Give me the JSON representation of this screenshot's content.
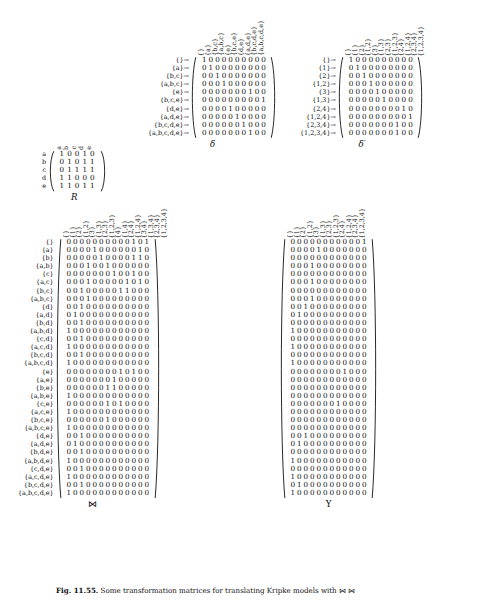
{
  "figure": {
    "caption_bold": "Fig. 11.55.",
    "caption_rest": "Some transformation matrices for translating Kripke models with ⋈ ⋈"
  },
  "blocks": {
    "R": {
      "label": "R",
      "row_labels": [
        "a",
        "b",
        "c",
        "d",
        "e"
      ],
      "col_labels": [
        "a",
        "b",
        "c",
        "d",
        "e"
      ],
      "col_rotated": true,
      "rows": [
        [
          1,
          0,
          0,
          1,
          0
        ],
        [
          0,
          1,
          0,
          1,
          1
        ],
        [
          0,
          1,
          1,
          1,
          1
        ],
        [
          1,
          1,
          0,
          0,
          0
        ],
        [
          1,
          1,
          0,
          1,
          1
        ]
      ]
    },
    "delta": {
      "label": "δ",
      "row_labels": [
        "{}→",
        "{a}→",
        "{b,c}→",
        "{a,b,c}→",
        "{e}→",
        "{b,c,e}→",
        "{d,e}→",
        "{a,d,e}→",
        "{b,c,d,e}→",
        "{a,b,c,d,e}→"
      ],
      "col_labels": [
        "{}",
        "{a}",
        "{b,c}",
        "{a,b,c}",
        "{e}",
        "{b,c,e}",
        "{d,e}",
        "{a,d,e}",
        "{b,c,d,e}",
        "{a,b,c,d,e}"
      ],
      "col_rotated": true,
      "rows": [
        [
          1,
          0,
          0,
          0,
          0,
          0,
          0,
          0,
          0,
          0
        ],
        [
          0,
          1,
          0,
          0,
          0,
          0,
          0,
          0,
          0,
          0
        ],
        [
          0,
          0,
          1,
          0,
          0,
          0,
          0,
          0,
          0,
          0
        ],
        [
          0,
          0,
          0,
          1,
          0,
          0,
          0,
          0,
          0,
          0
        ],
        [
          0,
          0,
          0,
          0,
          0,
          0,
          0,
          1,
          0,
          0
        ],
        [
          0,
          0,
          0,
          0,
          0,
          0,
          0,
          0,
          0,
          1
        ],
        [
          0,
          0,
          0,
          0,
          1,
          0,
          0,
          0,
          0,
          0
        ],
        [
          0,
          0,
          0,
          0,
          0,
          1,
          0,
          0,
          0,
          0
        ],
        [
          0,
          0,
          0,
          0,
          0,
          0,
          1,
          0,
          0,
          0
        ],
        [
          0,
          0,
          0,
          0,
          0,
          0,
          0,
          1,
          0,
          0
        ]
      ]
    },
    "delta_prime": {
      "label": "δ′",
      "row_labels": [
        "{}→",
        "{1}→",
        "{2}→",
        "{1,2}→",
        "{3}→",
        "{1,3}→",
        "{2,4}→",
        "{1,2,4}→",
        "{2,3,4}→",
        "{1,2,3,4}→"
      ],
      "col_labels": [
        "{}",
        "{1}",
        "{2}",
        "{1,2}",
        "{3}",
        "{1,3}",
        "{2,3}",
        "{1,2,3}",
        "{2,4}",
        "{1,2,4}",
        "{2,3,4}",
        "{1,2,3,4}"
      ],
      "col_rotated": true,
      "rows": [
        [
          1,
          0,
          0,
          0,
          0,
          0,
          0,
          0,
          0,
          0
        ],
        [
          0,
          1,
          0,
          0,
          0,
          0,
          0,
          0,
          0,
          0
        ],
        [
          0,
          0,
          1,
          0,
          0,
          0,
          0,
          0,
          0,
          0
        ],
        [
          0,
          0,
          0,
          1,
          0,
          0,
          0,
          0,
          0,
          0
        ],
        [
          0,
          0,
          0,
          0,
          1,
          0,
          0,
          0,
          0,
          0
        ],
        [
          0,
          0,
          0,
          0,
          0,
          1,
          0,
          0,
          0,
          0
        ],
        [
          0,
          0,
          0,
          0,
          0,
          0,
          0,
          0,
          1,
          0
        ],
        [
          0,
          0,
          0,
          0,
          0,
          0,
          0,
          0,
          0,
          1
        ],
        [
          0,
          0,
          0,
          0,
          0,
          0,
          0,
          1,
          0,
          0
        ],
        [
          0,
          0,
          0,
          0,
          0,
          0,
          0,
          1,
          0,
          0
        ]
      ]
    },
    "bowtie": {
      "label": "⋈",
      "row_labels": [
        "{}",
        "{a}",
        "{b}",
        "{a,b}",
        "{c}",
        "{a,c}",
        "{b,c}",
        "{a,b,c}",
        "{d}",
        "{a,d}",
        "{b,d}",
        "{a,b,d}",
        "{c,d}",
        "{a,c,d}",
        "{b,c,d}",
        "{a,b,c,d}",
        "{e}",
        "{a,e}",
        "{b,e}",
        "{a,b,e}",
        "{c,e}",
        "{a,c,e}",
        "{b,c,e}",
        "{a,b,c,e}",
        "{d,e}",
        "{a,d,e}",
        "{b,d,e}",
        "{a,b,d,e}",
        "{c,d,e}",
        "{a,c,d,e}",
        "{b,c,d,e}",
        "{a,b,c,d,e}"
      ],
      "col_labels": [
        "{}",
        "{1}",
        "{2}",
        "{1,2}",
        "{3}",
        "{1,3}",
        "{2,3}",
        "{1,2,3}",
        "{4}",
        "{1,4}",
        "{2,4}",
        "{1,2,4}",
        "{3,4}",
        "{1,3,4}",
        "{2,3,4}",
        "{1,2,3,4}"
      ],
      "col_rotated": true,
      "rows": [
        [
          0,
          0,
          0,
          0,
          0,
          0,
          0,
          0,
          0,
          0,
          1,
          0,
          1
        ],
        [
          0,
          0,
          0,
          0,
          1,
          0,
          0,
          0,
          0,
          0,
          0,
          1,
          0
        ],
        [
          0,
          0,
          0,
          0,
          0,
          1,
          0,
          0,
          0,
          0,
          1,
          1,
          0
        ],
        [
          0,
          0,
          0,
          1,
          0,
          0,
          1,
          0,
          0,
          0,
          0,
          0,
          0
        ],
        [
          0,
          0,
          0,
          0,
          0,
          0,
          0,
          1,
          0,
          0,
          1,
          0,
          0
        ],
        [
          0,
          0,
          0,
          1,
          0,
          0,
          0,
          0,
          0,
          1,
          0,
          1,
          0
        ],
        [
          0,
          0,
          1,
          0,
          0,
          0,
          0,
          0,
          1,
          1,
          0,
          0,
          0
        ],
        [
          0,
          0,
          0,
          1,
          0,
          0,
          0,
          0,
          0,
          0,
          0,
          0,
          0
        ],
        [
          0,
          0,
          1,
          0,
          0,
          0,
          0,
          0,
          0,
          0,
          0,
          0,
          0
        ],
        [
          0,
          1,
          0,
          0,
          0,
          0,
          0,
          0,
          0,
          0,
          0,
          0,
          0
        ],
        [
          0,
          0,
          1,
          0,
          0,
          0,
          0,
          0,
          0,
          0,
          0,
          0,
          0
        ],
        [
          1,
          0,
          0,
          0,
          0,
          0,
          0,
          0,
          0,
          0,
          0,
          0,
          0
        ],
        [
          0,
          0,
          1,
          0,
          0,
          0,
          0,
          0,
          0,
          0,
          0,
          0,
          0
        ],
        [
          1,
          0,
          0,
          0,
          0,
          0,
          0,
          0,
          0,
          0,
          0,
          0,
          0
        ],
        [
          0,
          0,
          1,
          0,
          0,
          0,
          0,
          0,
          0,
          0,
          0,
          0,
          0
        ],
        [
          1,
          0,
          0,
          0,
          0,
          0,
          0,
          0,
          0,
          0,
          0,
          0,
          0
        ],
        [
          0,
          0,
          0,
          0,
          0,
          0,
          0,
          0,
          1,
          0,
          1,
          0,
          0
        ],
        [
          0,
          0,
          0,
          0,
          0,
          0,
          0,
          1,
          0,
          0,
          0,
          0,
          0
        ],
        [
          0,
          0,
          0,
          0,
          0,
          0,
          1,
          1,
          0,
          0,
          0,
          0,
          0
        ],
        [
          1,
          0,
          0,
          0,
          0,
          0,
          0,
          0,
          0,
          0,
          0,
          0,
          0
        ],
        [
          0,
          0,
          0,
          0,
          0,
          0,
          1,
          0,
          1,
          0,
          0,
          0,
          0
        ],
        [
          1,
          0,
          0,
          0,
          0,
          0,
          0,
          0,
          0,
          0,
          0,
          0,
          0
        ],
        [
          0,
          0,
          0,
          0,
          0,
          0,
          1,
          0,
          0,
          0,
          0,
          0,
          0
        ],
        [
          1,
          0,
          0,
          0,
          0,
          0,
          0,
          0,
          0,
          0,
          0,
          0,
          0
        ],
        [
          0,
          0,
          1,
          0,
          0,
          0,
          0,
          0,
          0,
          0,
          0,
          0,
          0
        ],
        [
          0,
          1,
          0,
          0,
          0,
          0,
          0,
          0,
          0,
          0,
          0,
          0,
          0
        ],
        [
          0,
          0,
          1,
          0,
          0,
          0,
          0,
          0,
          0,
          0,
          0,
          0,
          0
        ],
        [
          1,
          0,
          0,
          0,
          0,
          0,
          0,
          0,
          0,
          0,
          0,
          0,
          0
        ],
        [
          0,
          0,
          1,
          0,
          0,
          0,
          0,
          0,
          0,
          0,
          0,
          0,
          0
        ],
        [
          1,
          0,
          0,
          0,
          0,
          0,
          0,
          0,
          0,
          0,
          0,
          0,
          0
        ],
        [
          0,
          0,
          1,
          0,
          0,
          0,
          0,
          0,
          0,
          0,
          0,
          0,
          0
        ],
        [
          1,
          0,
          0,
          0,
          0,
          0,
          0,
          0,
          0,
          0,
          0,
          0,
          0
        ]
      ]
    },
    "upsilon": {
      "label": "Υ",
      "col_labels": [
        "{}",
        "{1}",
        "{2}",
        "{1,2}",
        "{3}",
        "{1,3}",
        "{2,3}",
        "{1,2,3}",
        "{2,4}",
        "{1,2,4}",
        "{2,3,4}",
        "{1,2,3,4}"
      ],
      "col_rotated": true,
      "rows": [
        [
          0,
          0,
          0,
          0,
          0,
          0,
          0,
          0,
          0,
          0,
          0,
          1
        ],
        [
          0,
          0,
          0,
          0,
          1,
          0,
          0,
          0,
          0,
          0,
          0,
          0
        ],
        [
          0,
          0,
          0,
          0,
          0,
          0,
          0,
          0,
          0,
          0,
          0,
          0
        ],
        [
          0,
          0,
          0,
          1,
          0,
          0,
          0,
          0,
          0,
          0,
          0,
          0
        ],
        [
          0,
          0,
          0,
          0,
          0,
          0,
          0,
          0,
          0,
          0,
          0,
          0
        ],
        [
          0,
          0,
          0,
          1,
          0,
          0,
          0,
          0,
          0,
          0,
          0,
          0
        ],
        [
          0,
          0,
          0,
          0,
          0,
          0,
          0,
          0,
          0,
          0,
          0,
          0
        ],
        [
          0,
          0,
          0,
          1,
          0,
          0,
          0,
          0,
          0,
          0,
          0,
          0
        ],
        [
          0,
          0,
          1,
          0,
          0,
          0,
          0,
          0,
          0,
          0,
          0,
          0
        ],
        [
          0,
          1,
          0,
          0,
          0,
          0,
          0,
          0,
          0,
          0,
          0,
          0
        ],
        [
          0,
          0,
          0,
          0,
          0,
          0,
          0,
          0,
          0,
          0,
          0,
          0
        ],
        [
          1,
          0,
          0,
          0,
          0,
          0,
          0,
          0,
          0,
          0,
          0,
          0
        ],
        [
          0,
          0,
          0,
          0,
          0,
          0,
          0,
          0,
          0,
          0,
          0,
          0
        ],
        [
          1,
          0,
          0,
          0,
          0,
          0,
          0,
          0,
          0,
          0,
          0,
          0
        ],
        [
          0,
          0,
          0,
          0,
          0,
          0,
          0,
          0,
          0,
          0,
          0,
          0
        ],
        [
          1,
          0,
          0,
          0,
          0,
          0,
          0,
          0,
          0,
          0,
          0,
          0
        ],
        [
          0,
          0,
          0,
          0,
          0,
          0,
          0,
          0,
          1,
          0,
          0,
          0
        ],
        [
          0,
          0,
          0,
          0,
          0,
          0,
          0,
          0,
          0,
          0,
          0,
          0
        ],
        [
          0,
          0,
          0,
          0,
          0,
          0,
          0,
          0,
          0,
          0,
          0,
          0
        ],
        [
          0,
          0,
          0,
          0,
          0,
          0,
          0,
          0,
          0,
          0,
          0,
          0
        ],
        [
          0,
          0,
          0,
          0,
          0,
          0,
          0,
          1,
          0,
          0,
          0,
          0
        ],
        [
          0,
          0,
          0,
          0,
          0,
          0,
          0,
          0,
          0,
          0,
          0,
          0
        ],
        [
          0,
          0,
          0,
          0,
          0,
          0,
          0,
          0,
          0,
          0,
          0,
          0
        ],
        [
          0,
          0,
          0,
          0,
          0,
          0,
          0,
          0,
          0,
          0,
          0,
          0
        ],
        [
          0,
          0,
          1,
          0,
          0,
          0,
          0,
          0,
          0,
          0,
          0,
          0
        ],
        [
          0,
          1,
          0,
          0,
          0,
          0,
          0,
          0,
          0,
          0,
          0,
          0
        ],
        [
          0,
          0,
          0,
          0,
          0,
          0,
          0,
          0,
          0,
          0,
          0,
          0
        ],
        [
          1,
          0,
          0,
          0,
          0,
          0,
          0,
          0,
          0,
          0,
          0,
          0
        ],
        [
          0,
          0,
          0,
          0,
          0,
          0,
          0,
          0,
          0,
          0,
          0,
          0
        ],
        [
          1,
          0,
          0,
          0,
          0,
          0,
          0,
          0,
          0,
          0,
          0,
          0
        ],
        [
          0,
          1,
          0,
          0,
          0,
          0,
          0,
          0,
          0,
          0,
          0,
          0
        ],
        [
          1,
          0,
          0,
          0,
          0,
          0,
          0,
          0,
          0,
          0,
          0,
          0
        ]
      ]
    }
  }
}
